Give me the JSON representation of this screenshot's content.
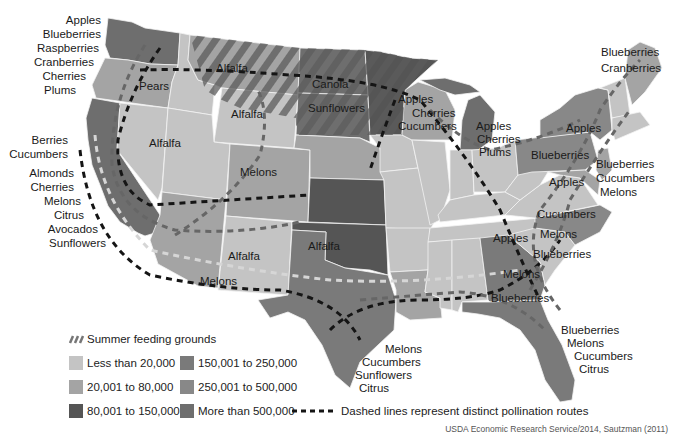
{
  "map": {
    "type": "choropleth",
    "subject": "Honeybee pollination routes and colony counts by state",
    "colors": {
      "less_20k": "#c4c4c4",
      "20k_80k": "#a4a4a4",
      "80k_150k": "#555555",
      "150k_250k": "#7a7a7a",
      "250k_500k": "#888888",
      "more_500k": "#6e6e6e",
      "hatch": "#6a6a6a",
      "route_dark": "#151515",
      "route_mid": "#666666",
      "route_light": "#d6d6d6"
    },
    "crop_labels": {
      "pnw": [
        "Apples",
        "Blueberries",
        "Raspberries",
        "Cranberries",
        "Cherries",
        "Plums"
      ],
      "oregon": "Pears",
      "ca_north": [
        "Berries",
        "Cucumbers"
      ],
      "ca_south": [
        "Almonds",
        "Cherries",
        "Melons",
        "Citrus",
        "Avocados",
        "Sunflowers"
      ],
      "nevada": "Alfalfa",
      "montana": "Alfalfa",
      "idaho_wy": "Alfalfa",
      "colorado": "Melons",
      "north_dakota": "Canola",
      "south_dakota": "Sunflowers",
      "wisconsin": [
        "Apples",
        "Cherries",
        "Cucumbers"
      ],
      "michigan": [
        "Apples",
        "Cherries",
        "Plums"
      ],
      "oklahoma": "Alfalfa",
      "new_mexico": "Alfalfa",
      "arizona": "Melons",
      "maine": [
        "Blueberries",
        "Cranberries"
      ],
      "new_york": "Apples",
      "pennsylvania": "Blueberries",
      "virginia_area": "Apples",
      "nj": [
        "Blueberries",
        "Cucumbers",
        "Melons"
      ],
      "va": "Cucumbers",
      "tennessee": "Apples",
      "nc": "Melons",
      "sc": "Blueberries",
      "georgia_melons": "Melons",
      "georgia_blueberries": "Blueberries",
      "texas": [
        "Melons",
        "Cucumbers",
        "Sunflowers",
        "Citrus"
      ],
      "florida": [
        "Blueberries",
        "Melons",
        "Cucumbers",
        "Citrus"
      ]
    }
  },
  "legend": {
    "hatch_label": "Summer feeding grounds",
    "items": [
      {
        "label": "Less than 20,000",
        "color": "#c4c4c4"
      },
      {
        "label": "20,001 to 80,000",
        "color": "#a4a4a4"
      },
      {
        "label": "80,001 to 150,000",
        "color": "#555555"
      },
      {
        "label": "150,001 to 250,000",
        "color": "#7a7a7a"
      },
      {
        "label": "250,001 to 500,000",
        "color": "#888888"
      },
      {
        "label": "More than 500,000",
        "color": "#6e6e6e"
      }
    ],
    "routes_label": "Dashed lines represent distinct pollination routes"
  },
  "credit": "USDA Economic Research Service/2014, Sautzman (2011)"
}
